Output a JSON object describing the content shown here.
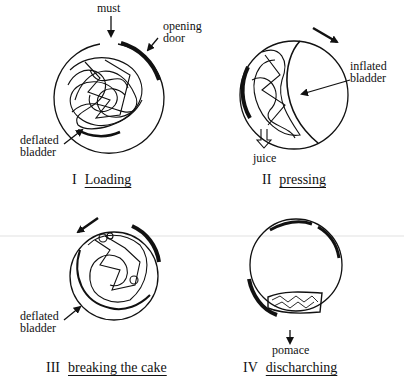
{
  "panels": [
    {
      "id": "loading",
      "numeral": "I",
      "caption": "Loading",
      "labels": {
        "input": "must",
        "door": "opening\ndoor",
        "bladder": "deflated\nbladder"
      }
    },
    {
      "id": "pressing",
      "numeral": "II",
      "caption": "pressing",
      "labels": {
        "bladder": "inflated\nbladder",
        "output": "juice"
      }
    },
    {
      "id": "breaking",
      "numeral": "III",
      "caption": "breaking the cake",
      "labels": {
        "bladder": "deflated\nbladder"
      }
    },
    {
      "id": "discharging",
      "numeral": "IV",
      "caption": "discharching",
      "labels": {
        "output": "pomace"
      }
    }
  ],
  "colors": {
    "ink": "#111111",
    "background": "#ffffff"
  }
}
